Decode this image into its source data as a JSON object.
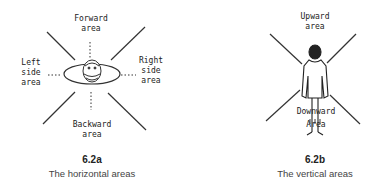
{
  "figure_a": {
    "labels": {
      "forward": [
        "Forward",
        "area"
      ],
      "left": [
        "Left",
        "side",
        "area"
      ],
      "right": [
        "Right",
        "side",
        "area"
      ],
      "backward": [
        "Backward",
        "area"
      ]
    },
    "number": "6.2a",
    "caption": "The horizontal areas"
  },
  "figure_b": {
    "labels": {
      "upward": [
        "Upward",
        "area"
      ],
      "downward": [
        "Downward",
        "Area"
      ]
    },
    "number": "6.2b",
    "caption": "The vertical areas"
  }
}
